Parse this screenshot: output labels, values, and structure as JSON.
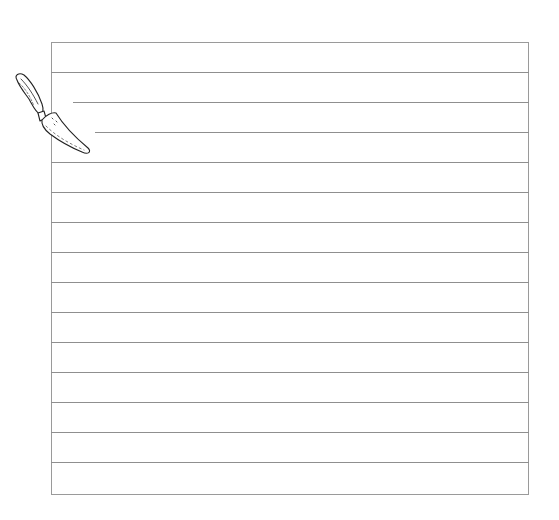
{
  "worksheet": {
    "type": "lined-writing-sheet",
    "line_count": 14,
    "line_spacing_px": 30,
    "first_line_y": 72,
    "short_lines": [
      {
        "index": 1,
        "start_x": 73
      },
      {
        "index": 2,
        "start_x": 95
      }
    ],
    "border_color": "#9a9a9a",
    "line_color": "#8f8f8f"
  },
  "illustration": {
    "icon": "garden-trowel-icon",
    "stroke_color": "#222222"
  }
}
